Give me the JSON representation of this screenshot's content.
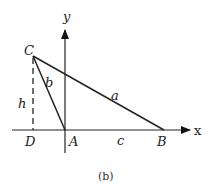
{
  "figure": {
    "caption": "(b)",
    "axes": {
      "x_label": "x",
      "y_label": "y"
    },
    "points": {
      "C": {
        "label": "C",
        "x": 33,
        "y": 56
      },
      "A": {
        "label": "A",
        "x": 65,
        "y": 130
      },
      "B": {
        "label": "B",
        "x": 164,
        "y": 130
      },
      "D": {
        "label": "D",
        "x": 33,
        "y": 130
      }
    },
    "sides": {
      "a": "a",
      "b": "b",
      "c": "c",
      "h": "h"
    },
    "colors": {
      "line": "#222222",
      "background": "#ffffff"
    }
  }
}
